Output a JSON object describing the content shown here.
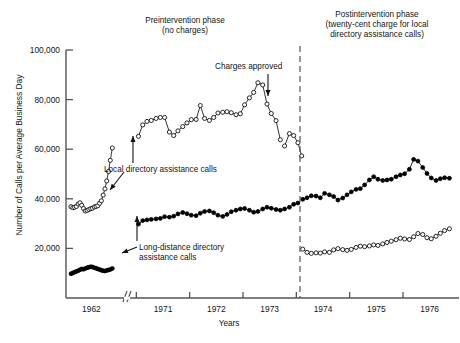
{
  "figure": {
    "y_axis_title": "Number of Calls per Average Business Day",
    "x_axis_title": "Years",
    "phase_left_line1": "Preintervention phase",
    "phase_left_line2": "(no charges)",
    "phase_right_line1": "Postintervention phase",
    "phase_right_line2": "(twenty-cent charge for local",
    "phase_right_line3": "directory assistance calls)",
    "annotation_charges": "Charges approved",
    "annotation_local_line1": "Local directory assistance calls",
    "annotation_longdistance_line1": "Long-distance directory",
    "annotation_longdistance_line2": "assistance calls",
    "axis_break_marker": "//"
  },
  "chart_data": {
    "type": "line",
    "title": "",
    "xlabel": "Years",
    "ylabel": "Number of Calls per Average Business Day",
    "ylim": [
      0,
      100000
    ],
    "ytick_labels": [
      "20,000",
      "40,000",
      "60,000",
      "80,000",
      "100,000"
    ],
    "ytick_values": [
      20000,
      40000,
      60000,
      80000,
      100000
    ],
    "xtick_labels": [
      "1962",
      "1971",
      "1972",
      "1973",
      "1974",
      "1975",
      "1976"
    ],
    "grid": false,
    "legend_position": "inline-annotations",
    "axis_break_after": "1962",
    "intervention_line_x_label": "late 1973",
    "series": [
      {
        "name": "Local directory assistance calls",
        "marker": "open-circle",
        "color": "#111111",
        "segments": [
          {
            "phase": "1962",
            "x": [
              0.02,
              0.055,
              0.09,
              0.125,
              0.16,
              0.195,
              0.23,
              0.265,
              0.3,
              0.335,
              0.37,
              0.405,
              0.44,
              0.475,
              0.51,
              0.545,
              0.58,
              0.615,
              0.65,
              0.685,
              0.72,
              0.755,
              0.79,
              0.83
            ],
            "values": [
              36800,
              36400,
              36600,
              36900,
              37900,
              38400,
              37400,
              36100,
              35100,
              35300,
              35700,
              36000,
              36200,
              36700,
              36900,
              37200,
              38200,
              39200,
              41500,
              44000,
              47200,
              51000,
              55500,
              60500
            ]
          },
          {
            "phase": "preintervention",
            "x": [
              1971.04,
              1971.12,
              1971.2,
              1971.28,
              1971.37,
              1971.45,
              1971.53,
              1971.62,
              1971.7,
              1971.78,
              1971.87,
              1971.95,
              1972.03,
              1972.12,
              1972.2,
              1972.28,
              1972.37,
              1972.45,
              1972.53,
              1972.62,
              1972.7,
              1972.78,
              1972.87,
              1972.95,
              1973.03,
              1973.12,
              1973.2,
              1973.28,
              1973.37,
              1973.45,
              1973.53,
              1973.62,
              1973.7
            ],
            "values": [
              65200,
              69800,
              71200,
              71600,
              72400,
              72800,
              72800,
              66900,
              65500,
              67400,
              69100,
              70600,
              71900,
              72000,
              77600,
              72400,
              71600,
              72800,
              74600,
              74900,
              75100,
              74700,
              73900,
              74300,
              77900,
              80700,
              82900,
              86800,
              85900,
              78200,
              74400,
              71500,
              63800
            ]
          },
          {
            "phase": "postintervention-tail",
            "x": [
              1973.78,
              1973.87,
              1973.95,
              1974.03,
              1974.1
            ],
            "values": [
              61300,
              66300,
              65500,
              62600,
              57300
            ]
          },
          {
            "phase": "postintervention",
            "x": [
              1974.12,
              1974.2,
              1974.28,
              1974.37,
              1974.45,
              1974.53,
              1974.62,
              1974.7,
              1974.78,
              1974.87,
              1974.95,
              1975.03,
              1975.12,
              1975.2,
              1975.28,
              1975.37,
              1975.45,
              1975.53,
              1975.62,
              1975.7,
              1975.78,
              1975.87,
              1975.95,
              1976.03,
              1976.12,
              1976.2,
              1976.28,
              1976.37,
              1976.45,
              1976.53,
              1976.62,
              1976.7,
              1976.78,
              1976.87
            ],
            "values": [
              19700,
              18400,
              18000,
              18200,
              18100,
              18600,
              18400,
              19400,
              19900,
              19500,
              19200,
              19600,
              20400,
              20900,
              20700,
              21000,
              21400,
              21200,
              21800,
              22400,
              22900,
              23500,
              24100,
              23800,
              23600,
              24700,
              26000,
              25600,
              24300,
              23900,
              24900,
              26100,
              27200,
              27900
            ]
          }
        ]
      },
      {
        "name": "Long-distance directory assistance calls",
        "marker": "filled-circle",
        "color": "#000000",
        "segments": [
          {
            "phase": "1962",
            "x": [
              0.02,
              0.055,
              0.09,
              0.125,
              0.16,
              0.195,
              0.23,
              0.265,
              0.3,
              0.335,
              0.37,
              0.405,
              0.44,
              0.475,
              0.51,
              0.545,
              0.58,
              0.615,
              0.65,
              0.685,
              0.72,
              0.755,
              0.79,
              0.83
            ],
            "values": [
              9800,
              10100,
              10400,
              10700,
              11000,
              11400,
              11700,
              11600,
              11900,
              12200,
              12400,
              12600,
              12500,
              12200,
              12000,
              11700,
              11500,
              11200,
              11000,
              10900,
              11100,
              11300,
              11500,
              11900
            ]
          },
          {
            "phase": "preintervention",
            "x": [
              1971.04,
              1971.12,
              1971.2,
              1971.28,
              1971.37,
              1971.45,
              1971.53,
              1971.62,
              1971.7,
              1971.78,
              1971.87,
              1971.95,
              1972.03,
              1972.12,
              1972.2,
              1972.28,
              1972.37,
              1972.45,
              1972.53,
              1972.62,
              1972.7,
              1972.78,
              1972.87,
              1972.95,
              1973.03,
              1973.12,
              1973.2,
              1973.28,
              1973.37,
              1973.45,
              1973.53,
              1973.62,
              1973.7,
              1973.78,
              1973.87,
              1973.95,
              1974.03
            ],
            "values": [
              29800,
              31200,
              31500,
              31700,
              31900,
              32100,
              32800,
              32600,
              33000,
              33900,
              34500,
              34000,
              33400,
              33200,
              34200,
              34900,
              35100,
              34400,
              33400,
              32900,
              33700,
              34800,
              35400,
              35900,
              36100,
              35400,
              34600,
              34900,
              35900,
              36600,
              36200,
              35700,
              35400,
              35900,
              36600,
              37800,
              38300
            ]
          },
          {
            "phase": "postintervention",
            "x": [
              1974.12,
              1974.2,
              1974.28,
              1974.37,
              1974.45,
              1974.53,
              1974.62,
              1974.7,
              1974.78,
              1974.87,
              1974.95,
              1975.03,
              1975.12,
              1975.2,
              1975.28,
              1975.37,
              1975.45,
              1975.53,
              1975.62,
              1975.7,
              1975.78,
              1975.87,
              1975.95,
              1976.03,
              1976.12,
              1976.2,
              1976.28,
              1976.37,
              1976.45,
              1976.53,
              1976.62,
              1976.7,
              1976.78,
              1976.87
            ],
            "values": [
              39800,
              40400,
              41200,
              41100,
              40400,
              42200,
              41600,
              40900,
              39500,
              40300,
              41600,
              42800,
              43800,
              44100,
              45600,
              47600,
              48900,
              47900,
              47400,
              47600,
              47900,
              48900,
              49600,
              50100,
              51900,
              55900,
              55200,
              52600,
              50200,
              48400,
              47400,
              48100,
              48500,
              48300
            ]
          }
        ]
      }
    ]
  }
}
